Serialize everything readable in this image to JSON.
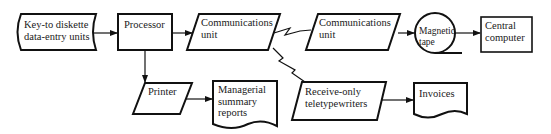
{
  "diagram": {
    "type": "system flowchart",
    "nodes": [
      {
        "id": "keyto",
        "shape": "stored-data",
        "lines": [
          "Key-to diskette",
          "data-entry units"
        ]
      },
      {
        "id": "processor",
        "shape": "process",
        "lines": [
          "Processor"
        ]
      },
      {
        "id": "comm1",
        "shape": "input-output",
        "lines": [
          "Communications",
          "unit"
        ]
      },
      {
        "id": "comm2",
        "shape": "input-output",
        "lines": [
          "Communications",
          "unit"
        ]
      },
      {
        "id": "tape",
        "shape": "magnetic-tape",
        "lines": [
          "Magnetic",
          "tape"
        ]
      },
      {
        "id": "central",
        "shape": "process",
        "lines": [
          "Central",
          "computer"
        ]
      },
      {
        "id": "printer",
        "shape": "input-output",
        "lines": [
          "Printer"
        ]
      },
      {
        "id": "managerial",
        "shape": "document",
        "lines": [
          "Managerial",
          "summary",
          "reports"
        ]
      },
      {
        "id": "receive",
        "shape": "input-output",
        "lines": [
          "Receive-only",
          "teletypewriters"
        ]
      },
      {
        "id": "invoices",
        "shape": "document",
        "lines": [
          "Invoices"
        ]
      }
    ],
    "edges": [
      {
        "from": "keyto",
        "to": "processor",
        "style": "arrow"
      },
      {
        "from": "processor",
        "to": "comm1",
        "style": "arrow"
      },
      {
        "from": "comm1",
        "to": "comm2",
        "style": "communication-link"
      },
      {
        "from": "comm2",
        "to": "tape",
        "style": "arrow"
      },
      {
        "from": "tape",
        "to": "central",
        "style": "arrow"
      },
      {
        "from": "processor",
        "to": "printer",
        "style": "arrow"
      },
      {
        "from": "printer",
        "to": "managerial",
        "style": "arrow"
      },
      {
        "from": "comm1",
        "to": "receive",
        "style": "communication-link"
      },
      {
        "from": "receive",
        "to": "invoices",
        "style": "arrow"
      }
    ]
  },
  "colors": {
    "stroke": "#111111",
    "background": "#ffffff",
    "text": "#1a1a1a"
  }
}
